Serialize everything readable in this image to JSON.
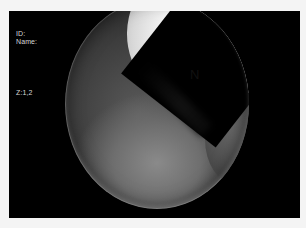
{
  "overlay": {
    "id_label": "ID:",
    "name_label": "Name:",
    "zoom_label": "Z:1,2"
  },
  "annotations": {
    "structure_label": "N"
  },
  "colors": {
    "frame_background": "#000000",
    "page_background": "#f4f4f4",
    "overlay_text": "#d8d8d8",
    "annotation_text": "#111111"
  }
}
